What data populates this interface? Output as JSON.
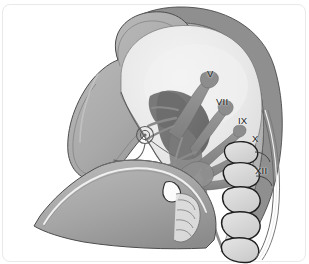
{
  "figure": {
    "style": "grayscale medical illustration",
    "width": 309,
    "height": 264
  },
  "palette": {
    "background": "#ffffff",
    "card_border": "#e9e9ea",
    "soft_tissue_outer": "#9a9a9a",
    "soft_tissue_mid": "#a8a8a8",
    "soft_tissue_light": "#bcbcbc",
    "cranial_cavity": "#e6e6e6",
    "cranial_cavity_light": "#f0f0f0",
    "brainstem_dark": "#6e6e6e",
    "nerve_gray": "#8c8c8c",
    "nerve_dark": "#707070",
    "vertebra_fill": "#dcdcdc",
    "outline_dark": "#2b2b2b",
    "outline_mid": "#5a5a5a",
    "highlight_white": "#f7f7f7",
    "label_text": "#1b1b1b"
  },
  "labels": [
    {
      "id": "nerve-v",
      "text": "V",
      "x": 207,
      "y": 69,
      "nerve": "trigeminal"
    },
    {
      "id": "nerve-vii",
      "text": "VII",
      "x": 216,
      "y": 97,
      "nerve": "facial"
    },
    {
      "id": "nerve-ix",
      "text": "IX",
      "x": 238,
      "y": 116,
      "nerve": "glossopharyngeal"
    },
    {
      "id": "nerve-x",
      "text": "X",
      "x": 252,
      "y": 134,
      "nerve": "vagus"
    },
    {
      "id": "nerve-xii",
      "text": "XII",
      "x": 255,
      "y": 166,
      "nerve": "hypoglossal"
    }
  ],
  "structures": [
    {
      "id": "scalp-outline",
      "name": "scalp and skull outer contour"
    },
    {
      "id": "cranial-cavity",
      "name": "cranial cavity"
    },
    {
      "id": "frontal-region",
      "name": "frontal / facial soft tissue"
    },
    {
      "id": "inner-ear-coil",
      "name": "inner ear cochlea coil"
    },
    {
      "id": "mandible",
      "name": "mandible and submandibular region"
    },
    {
      "id": "brainstem",
      "name": "brainstem"
    },
    {
      "id": "cranial-nerves",
      "name": "cranial nerve trunks and branches"
    },
    {
      "id": "cervical-spine",
      "name": "cervical vertebral bodies"
    },
    {
      "id": "larynx-airway",
      "name": "larynx and upper airway"
    },
    {
      "id": "posterior-neck",
      "name": "posterior neck soft tissue layers"
    }
  ]
}
